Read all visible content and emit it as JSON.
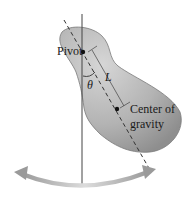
{
  "diagram": {
    "labels": {
      "pivot": "Pivot",
      "length": "L",
      "angle": "θ",
      "cog_line1": "Center of",
      "cog_line2": "gravity"
    },
    "colors": {
      "body_fill": "#a9a9a9",
      "body_light": "#d2d2d2",
      "arrow": "#b5b5b5",
      "line": "#333333"
    }
  }
}
